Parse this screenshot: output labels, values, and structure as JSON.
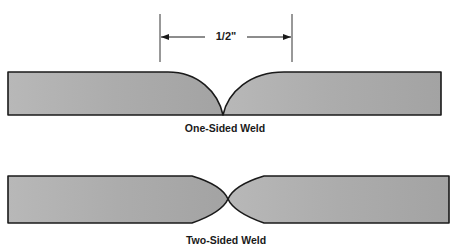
{
  "diagram": {
    "dimension": {
      "label": "1/2\"",
      "left_x": 160,
      "right_x": 292,
      "line_y": 37
    },
    "one_sided_weld": {
      "caption": "One-Sided Weld"
    },
    "two_sided_weld": {
      "caption": "Two-Sided Weld"
    },
    "colors": {
      "plate_fill": "#a9a9a9",
      "plate_fill_light": "#bdbdbd",
      "stroke": "#1a1a1a"
    }
  }
}
